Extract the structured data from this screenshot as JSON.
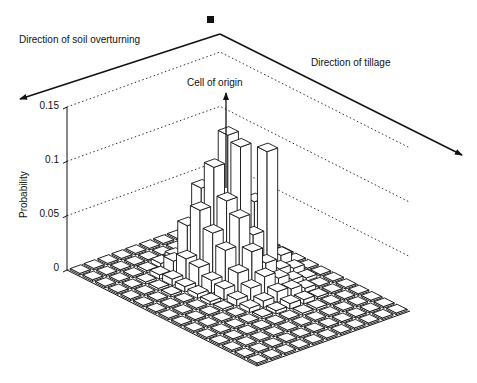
{
  "chart_data": {
    "type": "bar3d",
    "title": "",
    "ylabel": "Probability",
    "zlim": [
      0,
      0.15
    ],
    "z_ticks": [
      "0",
      "0.05",
      "0.1",
      "0.15"
    ],
    "z_tick_values": [
      0,
      0.05,
      0.1,
      0.15
    ],
    "grid_rows": 11,
    "grid_cols": 15,
    "annotations": {
      "soil_overturning": "Direction of soil overturning",
      "tillage": "Direction of tillage",
      "origin": "Cell of origin"
    },
    "heights": [
      [
        0,
        0,
        0,
        0,
        0,
        0,
        0,
        0,
        0,
        0,
        0,
        0,
        0,
        0,
        0
      ],
      [
        0,
        0,
        0,
        0,
        0,
        0.008,
        0.012,
        0.006,
        0.003,
        0,
        0,
        0,
        0,
        0,
        0
      ],
      [
        0,
        0,
        0,
        0.004,
        0.01,
        0.06,
        0.112,
        0.01,
        0.006,
        0.004,
        0.002,
        0,
        0,
        0,
        0
      ],
      [
        0,
        0,
        0.018,
        0.03,
        0.12,
        0.115,
        0.04,
        0.02,
        0.012,
        0.008,
        0.004,
        0.002,
        0,
        0,
        0
      ],
      [
        0,
        0,
        0.012,
        0.07,
        0.095,
        0.07,
        0.06,
        0.035,
        0.018,
        0.01,
        0.005,
        0.002,
        0,
        0,
        0
      ],
      [
        0,
        0,
        0.006,
        0.04,
        0.06,
        0.045,
        0.035,
        0.02,
        0.012,
        0.006,
        0.003,
        0,
        0,
        0,
        0
      ],
      [
        0,
        0,
        0.004,
        0.012,
        0.02,
        0.018,
        0.012,
        0.01,
        0.006,
        0.004,
        0.002,
        0,
        0,
        0,
        0
      ],
      [
        0,
        0,
        0.002,
        0.004,
        0.006,
        0.005,
        0.004,
        0.003,
        0.002,
        0.001,
        0,
        0,
        0,
        0,
        0
      ],
      [
        0,
        0,
        0,
        0.002,
        0.002,
        0.002,
        0.001,
        0.001,
        0,
        0,
        0,
        0,
        0,
        0,
        0
      ],
      [
        0,
        0,
        0,
        0,
        0,
        0,
        0,
        0,
        0,
        0,
        0,
        0,
        0,
        0,
        0
      ],
      [
        0,
        0,
        0,
        0,
        0,
        0,
        0,
        0,
        0,
        0,
        0,
        0,
        0,
        0,
        0
      ]
    ]
  },
  "labels": {
    "soil_overturning": "Direction of soil overturning",
    "tillage": "Direction of tillage",
    "origin": "Cell of origin",
    "ylabel": "Probability",
    "ticks": [
      "0.15",
      "0.1",
      "0.05",
      "0"
    ]
  }
}
